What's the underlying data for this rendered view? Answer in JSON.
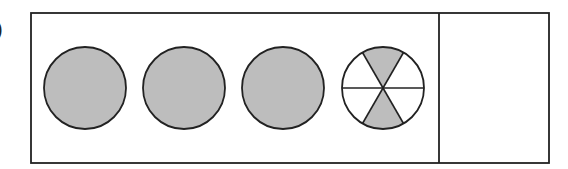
{
  "diagram": {
    "label": ")",
    "colors": {
      "stroke": "#222222",
      "fill": "#bdbdbd",
      "background": "#ffffff"
    },
    "circles": [
      {
        "id": "circle-1",
        "parts": 6,
        "shaded": 6
      },
      {
        "id": "circle-2",
        "parts": 6,
        "shaded": 6
      },
      {
        "id": "circle-3",
        "parts": 6,
        "shaded": 6
      },
      {
        "id": "circle-4",
        "parts": 6,
        "shaded": 2
      }
    ],
    "answer_box": {
      "content": ""
    }
  }
}
